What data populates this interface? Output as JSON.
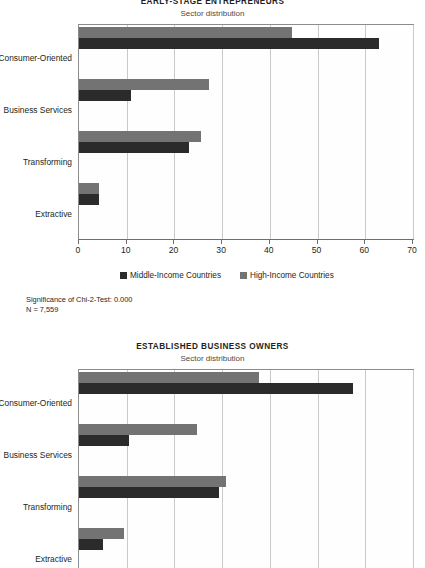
{
  "chart_data": [
    {
      "type": "bar",
      "orientation": "horizontal",
      "title": "EARLY-STAGE ENTREPRENEURS",
      "subtitle": "Sector distribution",
      "categories": [
        "Consumer-Oriented",
        "Business Services",
        "Transforming",
        "Extractive"
      ],
      "series": [
        {
          "name": "Middle-Income Countries",
          "color": "#2b2b2b",
          "values": [
            62.9,
            10.9,
            23.1,
            4.2
          ]
        },
        {
          "name": "High-Income Countries",
          "color": "#737373",
          "values": [
            44.6,
            27.2,
            25.6,
            4.2
          ]
        }
      ],
      "xlabel": "",
      "ylabel": "",
      "xlim": [
        0,
        70
      ],
      "xticks": [
        0,
        10,
        20,
        30,
        40,
        50,
        60,
        70
      ],
      "xtick_labels": [
        "0",
        "10",
        "20",
        "30",
        "40",
        "50",
        "60",
        "70"
      ],
      "grid": true,
      "legend_position": "bottom",
      "notes": [
        "Significance of Chi-2-Test: 0.000",
        "N = 7,559"
      ]
    },
    {
      "type": "bar",
      "orientation": "horizontal",
      "title": "ESTABLISHED BUSINESS OWNERS",
      "subtitle": "Sector distribution",
      "categories": [
        "Consumer-Oriented",
        "Business Services",
        "Transforming",
        "Extractive"
      ],
      "series": [
        {
          "name": "Middle-Income Countries",
          "color": "#2b2b2b",
          "values": [
            57.4,
            10.5,
            29.3,
            5.0
          ]
        },
        {
          "name": "High-Income Countries",
          "color": "#737373",
          "values": [
            37.7,
            24.7,
            30.8,
            9.4
          ]
        }
      ],
      "xlabel": "",
      "ylabel": "",
      "xlim": [
        0,
        70
      ],
      "xticks": [
        0,
        10,
        20,
        30,
        40,
        50,
        60,
        70
      ],
      "xtick_labels": [
        "0",
        "10",
        "20",
        "30",
        "40",
        "50",
        "60",
        "70"
      ],
      "grid": true,
      "legend_position": "none",
      "notes": []
    }
  ],
  "panel1": {
    "title": "EARLY-STAGE ENTREPRENEURS",
    "subtitle": "Sector distribution",
    "categories": [
      "Consumer-Oriented",
      "Business Services",
      "Transforming",
      "Extractive"
    ],
    "ticks": [
      "0",
      "10",
      "20",
      "30",
      "40",
      "50",
      "60",
      "70"
    ],
    "legend": {
      "middle_label": "Middle-Income Countries",
      "high_label": "High-Income Countries"
    },
    "footnote": {
      "line1": "Significance of Chi-2-Test: 0.000",
      "line2": "N = 7,559"
    }
  },
  "panel2": {
    "title": "ESTABLISHED BUSINESS OWNERS",
    "subtitle": "Sector distribution",
    "categories": [
      "Consumer-Oriented",
      "Business Services",
      "Transforming",
      "Extractive"
    ],
    "ticks": [
      "0",
      "10",
      "20",
      "30",
      "40",
      "50",
      "60",
      "70"
    ]
  },
  "colors": {
    "middle_income": "#2b2b2b",
    "high_income": "#737373",
    "grid": "#c9c9c9",
    "axis": "#8c8c8c"
  }
}
